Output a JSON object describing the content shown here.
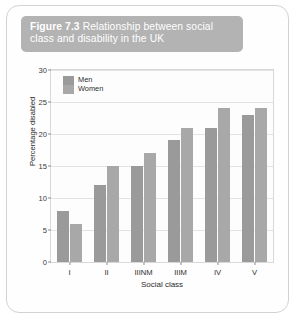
{
  "figure": {
    "number_label": "Figure 7.3",
    "caption": " Relationship between social class and disability in the UK"
  },
  "colors": {
    "banner": "#b3b3b3",
    "men_bar": "#9a9a9a",
    "women_bar": "#a8a8a8",
    "grid": "#e3e3e3",
    "card_border": "#d2d2d2"
  },
  "chart_data": {
    "type": "bar",
    "title": "Relationship between social class and disability in the UK",
    "xlabel": "Social class",
    "ylabel": "Percentage disabled",
    "categories": [
      "I",
      "II",
      "IIINM",
      "IIIM",
      "IV",
      "V"
    ],
    "series": [
      {
        "name": "Men",
        "values": [
          8,
          12,
          15,
          19,
          21,
          23
        ]
      },
      {
        "name": "Women",
        "values": [
          6,
          15,
          17,
          21,
          24,
          24
        ]
      }
    ],
    "ylim": [
      0,
      30
    ],
    "ytick_values": [
      0,
      5,
      10,
      15,
      20,
      25,
      30
    ],
    "ytick_labels": [
      "0",
      "5",
      "10",
      "15",
      "20",
      "25",
      "30"
    ],
    "grid": true,
    "legend_position": "top-left-inside"
  }
}
